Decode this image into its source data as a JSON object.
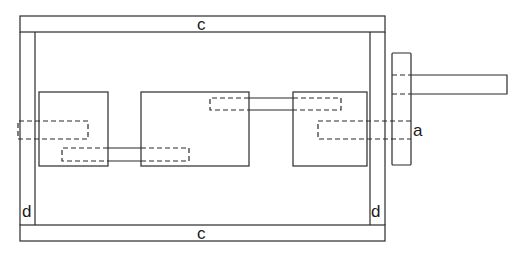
{
  "diagram": {
    "type": "mechanical gearbox schematic",
    "labels": {
      "top_bar": "c",
      "bottom_bar": "c",
      "left_post": "d",
      "right_post": "d",
      "output_flange": "a"
    },
    "components": [
      {
        "id": "frame-top-bar",
        "label": "c"
      },
      {
        "id": "frame-bottom-bar",
        "label": "c"
      },
      {
        "id": "frame-left-post",
        "label": "d"
      },
      {
        "id": "frame-right-post",
        "label": "d"
      },
      {
        "id": "left-block"
      },
      {
        "id": "middle-block"
      },
      {
        "id": "right-block"
      },
      {
        "id": "output-flange",
        "label": "a"
      },
      {
        "id": "output-shaft"
      }
    ],
    "colors": {
      "line": "#2a2a2a",
      "background": "#ffffff"
    }
  }
}
